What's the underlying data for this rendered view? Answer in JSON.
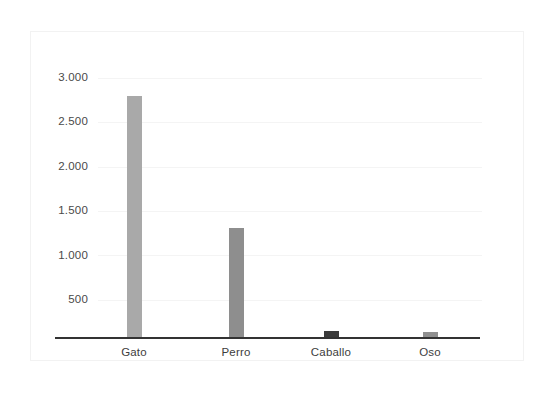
{
  "chart_data": {
    "type": "bar",
    "title": "",
    "subtitle": "",
    "xlabel": "",
    "ylabel": "",
    "categories": [
      "Gato",
      "Perro",
      "Caballo",
      "Oso"
    ],
    "values": [
      2800,
      1310,
      150,
      130
    ],
    "series": [
      {
        "name": "",
        "values": [
          2800,
          1310,
          150,
          130
        ]
      }
    ],
    "ylim": [
      0,
      3000
    ],
    "yticks": [
      500,
      1000,
      1500,
      2000,
      2500,
      3000
    ],
    "ytick_labels": [
      "500",
      "1.000",
      "1.500",
      "2.000",
      "2.500",
      "3.000"
    ],
    "grid": true,
    "legend": false,
    "legend_position": "none",
    "annotations": [],
    "bar_colors": [
      "#a9a9a9",
      "#8e8e8e",
      "#3b3b3b",
      "#909090"
    ],
    "axis_color": "#333333",
    "gridline_color": "#f4f4f4",
    "tick_text_color": "#4a4a4a",
    "background_color": "#ffffff",
    "frame_color": "#f2f2f2"
  }
}
